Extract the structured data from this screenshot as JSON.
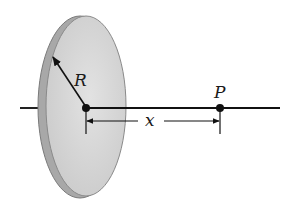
{
  "diagram": {
    "labels": {
      "radius": "R",
      "point": "P",
      "distance": "x"
    },
    "colors": {
      "disk_face": "#d4d4d4",
      "disk_rim": "#a9a9a9",
      "disk_outline": "#7a7a7a",
      "line": "#111111"
    },
    "elements": [
      {
        "name": "disk",
        "type": "ellipse"
      },
      {
        "name": "axis",
        "type": "line"
      },
      {
        "name": "center-point",
        "type": "dot"
      },
      {
        "name": "point-P",
        "type": "dot"
      },
      {
        "name": "radius-arrow",
        "type": "arrow"
      },
      {
        "name": "distance-dimension",
        "type": "dimension-arrow"
      }
    ]
  }
}
